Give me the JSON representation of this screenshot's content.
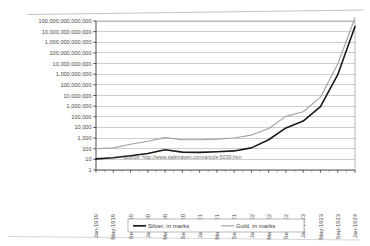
{
  "chart_data": {
    "type": "line",
    "title": "",
    "subtitle": "",
    "xlabel": "",
    "ylabel": "",
    "yscale": "log",
    "ylim": [
      1,
      100000000000000
    ],
    "grid": true,
    "legend_position": "bottom",
    "annotation": "Source:  http://www.safehaven.com/article-5039.htm",
    "ytick_labels": [
      "100,000,000,000,000",
      "10,000,000,000,000",
      "1,000,000,000,000",
      "100,000,000,000",
      "10,000,000,000",
      "1,000,000,000",
      "100,000,000",
      "10,000,000",
      "1,000,000",
      "100,000",
      "10,000",
      "1,000",
      "100",
      "10",
      "1"
    ],
    "ytick_values": [
      100000000000000,
      10000000000000,
      1000000000000,
      100000000000,
      10000000000,
      1000000000,
      100000000,
      10000000,
      1000000,
      100000,
      10000,
      1000,
      100,
      10,
      1
    ],
    "xtick_labels": [
      "Jan-1919",
      "May-1919",
      "Sep-1919",
      "Jan-1920",
      "May-1920",
      "Sep-1920",
      "Jan-1921",
      "May-1921",
      "Sep-1921",
      "Jan-1922",
      "May-1922",
      "Sep-1922",
      "Jan-1923",
      "May-1923",
      "Sep-1923",
      "Jan-1924"
    ],
    "categories": [
      "Jan-1919",
      "May-1919",
      "Sep-1919",
      "Jan-1920",
      "May-1920",
      "Sep-1920",
      "Jan-1921",
      "May-1921",
      "Sep-1921",
      "Jan-1922",
      "May-1922",
      "Sep-1922",
      "Jan-1923",
      "May-1923",
      "Sep-1923",
      "Jan-1924"
    ],
    "series": [
      {
        "name": "Silver, in marks",
        "color": "#1a1a1a",
        "width": 1.6,
        "x": [
          0,
          1,
          2,
          3,
          4,
          5,
          6,
          7,
          8,
          9,
          10,
          11,
          12,
          13,
          14,
          15
        ],
        "values": [
          11,
          14,
          22,
          36,
          80,
          48,
          45,
          52,
          62,
          120,
          700,
          9000,
          40000,
          900000,
          900000000,
          30000000000000
        ]
      },
      {
        "name": "Gold, in marks",
        "color": "#a0a0a0",
        "width": 1.1,
        "x": [
          0,
          1,
          2,
          3,
          4,
          5,
          6,
          7,
          8,
          9,
          10,
          11,
          12,
          13,
          14,
          15
        ],
        "values": [
          100,
          120,
          260,
          500,
          1100,
          700,
          700,
          800,
          1000,
          1900,
          8000,
          110000,
          300000,
          7000000,
          9000000000,
          200000000000000
        ]
      }
    ]
  },
  "legend": {
    "items": [
      {
        "label": "Silver, in marks",
        "color": "#1a1a1a"
      },
      {
        "label": "Gold, in marks",
        "color": "#a0a0a0"
      }
    ]
  },
  "source": {
    "text": "Source:  http://www.safehaven.com/article-5039.htm"
  }
}
